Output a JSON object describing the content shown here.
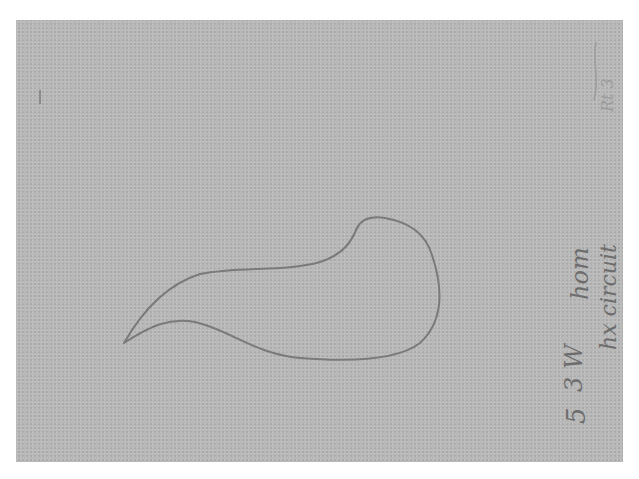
{
  "sheet": {
    "paper_color": "#b9b9b9",
    "border_color": "#ffffff",
    "ink_color": "#6d6d6d"
  },
  "drawing": {
    "description": "hand-drawn closed comma/teardrop-shaped outline with a pointed tail at lower left",
    "stroke_color": "#7a7a7a"
  },
  "annotations": {
    "outer_label": "hx circuit",
    "inner_label": "hom",
    "lower_mark": "3 W",
    "bottom_mark": "5",
    "top_mark": "Rt 3"
  }
}
